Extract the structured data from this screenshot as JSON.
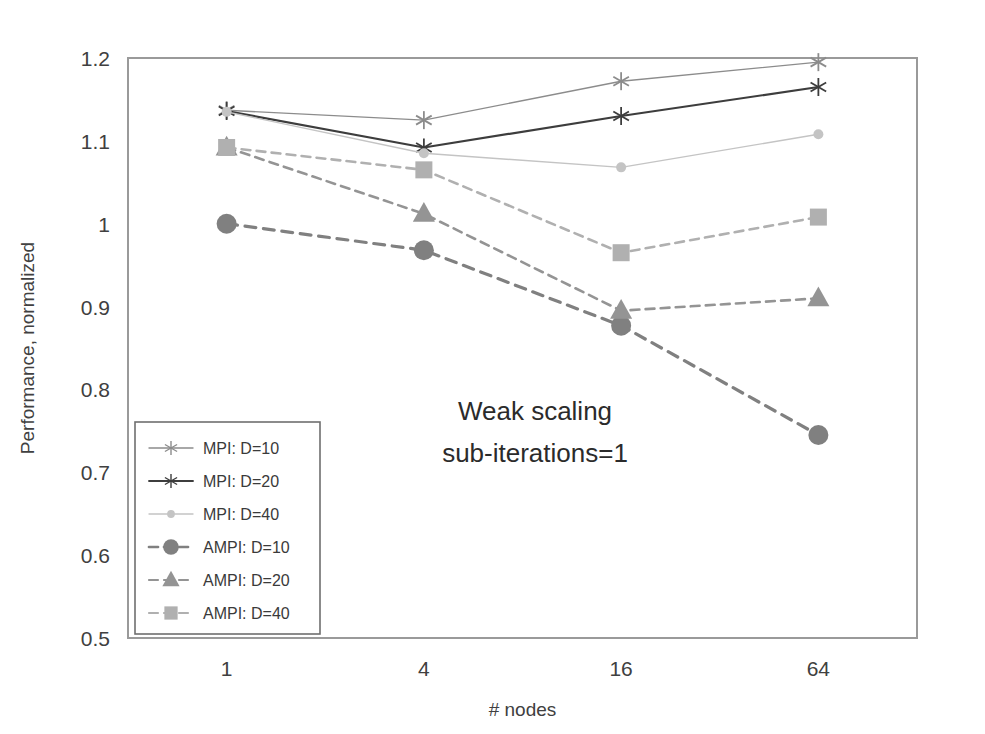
{
  "chart_data": {
    "type": "line",
    "title": "",
    "annotation": [
      "Weak scaling",
      "sub-iterations=1"
    ],
    "xlabel": "# nodes",
    "ylabel": "Performance, normalized",
    "categories": [
      "1",
      "4",
      "16",
      "64"
    ],
    "x": [
      1,
      4,
      16,
      64
    ],
    "yticks": [
      "0.5",
      "0.6",
      "0.7",
      "0.8",
      "0.9",
      "1",
      "1.1",
      "1.2"
    ],
    "ylim": [
      0.5,
      1.2
    ],
    "grid": false,
    "legend_position": "lower-left-inside",
    "series": [
      {
        "name": "MPI: D=10",
        "values": [
          1.137,
          1.125,
          1.172,
          1.195
        ],
        "color": "#8c8c8c",
        "marker": "star",
        "dash": "solid",
        "width": 1.4
      },
      {
        "name": "MPI: D=20",
        "values": [
          1.136,
          1.092,
          1.13,
          1.165
        ],
        "color": "#3d3d3d",
        "marker": "star",
        "dash": "solid",
        "width": 2.2
      },
      {
        "name": "MPI: D=40",
        "values": [
          1.135,
          1.085,
          1.068,
          1.108
        ],
        "color": "#c4c4c4",
        "marker": "dot",
        "dash": "solid",
        "width": 1.4
      },
      {
        "name": "AMPI: D=10",
        "values": [
          1.0,
          0.968,
          0.877,
          0.745
        ],
        "color": "#808080",
        "marker": "circle",
        "dash": "dashed",
        "width": 3.2
      },
      {
        "name": "AMPI: D=20",
        "values": [
          1.092,
          1.012,
          0.895,
          0.91
        ],
        "color": "#949494",
        "marker": "triangle",
        "dash": "dashed",
        "width": 2.6
      },
      {
        "name": "AMPI: D=40",
        "values": [
          1.092,
          1.065,
          0.965,
          1.008
        ],
        "color": "#b0b0b0",
        "marker": "square",
        "dash": "dashed",
        "width": 2.6
      }
    ]
  }
}
